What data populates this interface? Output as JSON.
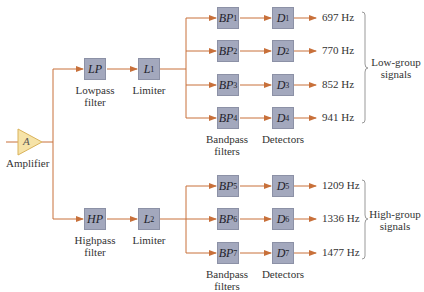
{
  "diagram": {
    "type": "block-diagram",
    "colors": {
      "wire": "#c8703a",
      "box_fill": "#a3a8bd",
      "amplifier_fill": "#f6e3a8",
      "amplifier_stroke": "#d9b25a",
      "brace": "#999999"
    },
    "amplifier": {
      "symbol": "A",
      "label": "Amplifier"
    },
    "low_path": {
      "filter": {
        "symbol": "LP",
        "label_line1": "Lowpass",
        "label_line2": "filter"
      },
      "limiter": {
        "symbol": "L",
        "sub": "1",
        "label": "Limiter"
      },
      "bandpass_label_line1": "Bandpass",
      "bandpass_label_line2": "filters",
      "detectors_label": "Detectors",
      "channels": [
        {
          "bp": "BP",
          "bp_sub": "1",
          "d": "D",
          "d_sub": "1",
          "freq": "697 Hz"
        },
        {
          "bp": "BP",
          "bp_sub": "2",
          "d": "D",
          "d_sub": "2",
          "freq": "770 Hz"
        },
        {
          "bp": "BP",
          "bp_sub": "3",
          "d": "D",
          "d_sub": "3",
          "freq": "852 Hz"
        },
        {
          "bp": "BP",
          "bp_sub": "4",
          "d": "D",
          "d_sub": "4",
          "freq": "941 Hz"
        }
      ],
      "group_label_line1": "Low-group",
      "group_label_line2": "signals"
    },
    "high_path": {
      "filter": {
        "symbol": "HP",
        "label_line1": "Highpass",
        "label_line2": "filter"
      },
      "limiter": {
        "symbol": "L",
        "sub": "2",
        "label": "Limiter"
      },
      "bandpass_label_line1": "Bandpass",
      "bandpass_label_line2": "filters",
      "detectors_label": "Detectors",
      "channels": [
        {
          "bp": "BP",
          "bp_sub": "5",
          "d": "D",
          "d_sub": "5",
          "freq": "1209 Hz"
        },
        {
          "bp": "BP",
          "bp_sub": "6",
          "d": "D",
          "d_sub": "6",
          "freq": "1336 Hz"
        },
        {
          "bp": "BP",
          "bp_sub": "7",
          "d": "D",
          "d_sub": "7",
          "freq": "1477 Hz"
        }
      ],
      "group_label_line1": "High-group",
      "group_label_line2": "signals"
    }
  }
}
